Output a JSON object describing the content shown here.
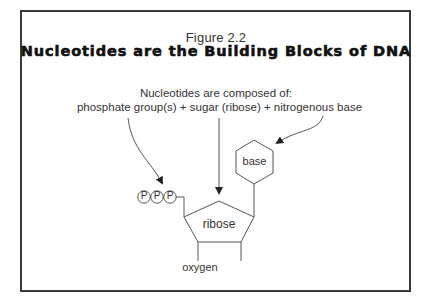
{
  "figure": {
    "label": "Figure 2.2",
    "title": "Nucleotides are the Building Blocks of DNA"
  },
  "caption": {
    "line1": "Nucleotides are composed of:",
    "line2": "phosphate group(s) + sugar (ribose) + nitrogenous base"
  },
  "diagram": {
    "phosphates": [
      "P",
      "P",
      "P"
    ],
    "sugar_label": "ribose",
    "base_label": "base",
    "oxygen_label": "oxygen",
    "arrows": [
      {
        "from": "phosphate group(s)",
        "to": "phosphates"
      },
      {
        "from": "sugar (ribose)",
        "to": "ribose"
      },
      {
        "from": "nitrogenous base",
        "to": "base"
      }
    ]
  },
  "colors": {
    "line": "#555555",
    "text": "#333333",
    "frame": "#3a3a3a"
  }
}
